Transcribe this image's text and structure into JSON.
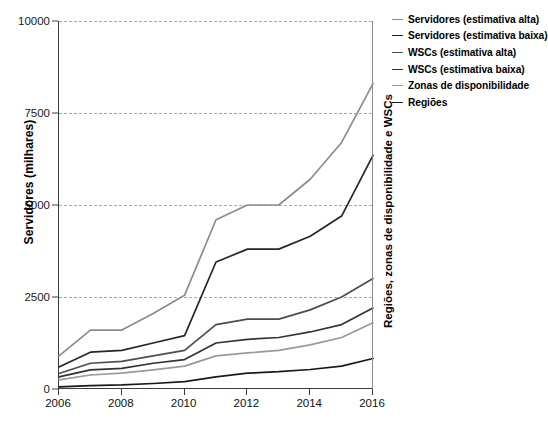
{
  "chart_data": {
    "type": "line",
    "title": "",
    "xlabel": "",
    "ylabel": "Servidores (milhares)",
    "ylabel_right": "Regiões, zonas de disponibilidade e WSCs",
    "x": [
      2006,
      2007,
      2008,
      2009,
      2010,
      2011,
      2012,
      2013,
      2014,
      2015,
      2016
    ],
    "xlim": [
      2006,
      2016
    ],
    "ylim": [
      0,
      10000
    ],
    "xticks": [
      2006,
      2008,
      2010,
      2012,
      2014,
      2016
    ],
    "xticklabels": [
      "2006",
      "2008",
      "2010",
      "2012",
      "2014",
      "2016"
    ],
    "yticks": [
      0,
      2500,
      5000,
      7500,
      10000
    ],
    "yticklabels": [
      "0",
      "2500",
      "5000",
      "7500",
      "10000"
    ],
    "grid": true,
    "grid_axis": "y",
    "grid_style": "dashed",
    "legend_position": "upper right outside",
    "series": [
      {
        "name": "Servidores (estimativa alta)",
        "color": "#8c8c8c",
        "values": [
          900,
          1600,
          1600,
          2050,
          2550,
          4600,
          5000,
          5000,
          5700,
          6700,
          8300
        ]
      },
      {
        "name": "Servidores (estimativa baixa)",
        "color": "#262626",
        "values": [
          600,
          1000,
          1050,
          1250,
          1450,
          3450,
          3800,
          3800,
          4150,
          4700,
          6350
        ]
      },
      {
        "name": "WSCs (estimativa alta)",
        "color": "#4d4d4d",
        "values": [
          420,
          700,
          750,
          900,
          1050,
          1750,
          1900,
          1900,
          2150,
          2500,
          3000
        ]
      },
      {
        "name": "WSCs (estimativa baixa)",
        "color": "#333333",
        "values": [
          330,
          520,
          560,
          700,
          800,
          1250,
          1350,
          1400,
          1550,
          1750,
          2200
        ]
      },
      {
        "name": "Zonas de disponibilidade",
        "color": "#999999",
        "values": [
          250,
          380,
          430,
          520,
          620,
          900,
          980,
          1050,
          1200,
          1400,
          1800
        ]
      },
      {
        "name": "Regiões",
        "color": "#1a1a1a",
        "values": [
          60,
          90,
          110,
          150,
          200,
          330,
          430,
          470,
          530,
          620,
          830
        ]
      }
    ]
  },
  "legend": {
    "items": [
      "Servidores (estimativa alta)",
      "Servidores (estimativa baixa)",
      "WSCs (estimativa alta)",
      "WSCs (estimativa baixa)",
      "Zonas de disponibilidade",
      "Regiões"
    ]
  },
  "caption": {
    "text": ""
  }
}
